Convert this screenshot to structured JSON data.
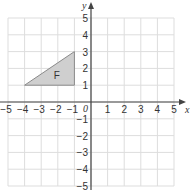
{
  "diagram": {
    "type": "coordinate-grid",
    "x_axis": {
      "label": "x",
      "min": -5,
      "max": 5,
      "ticks": [
        -5,
        -4,
        -3,
        -2,
        -1,
        1,
        2,
        3,
        4,
        5
      ]
    },
    "y_axis": {
      "label": "y",
      "min": -5,
      "max": 5,
      "ticks": [
        5,
        4,
        3,
        2,
        1,
        -1,
        -2,
        -3,
        -4,
        -5
      ]
    },
    "origin_label": "0",
    "shape": {
      "label": "F",
      "type": "triangle",
      "vertices": [
        [
          -4,
          1
        ],
        [
          -1,
          1
        ],
        [
          -1,
          3
        ]
      ],
      "fill": "#cfcfcf",
      "stroke": "#8a8a8a"
    },
    "colors": {
      "grid": "#dddddd",
      "axis": "#444444"
    }
  }
}
